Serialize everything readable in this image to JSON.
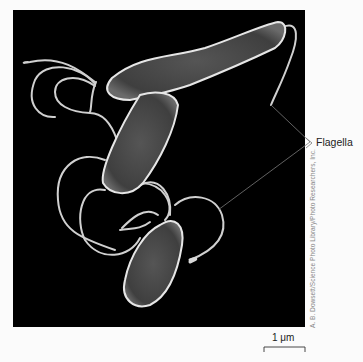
{
  "figure": {
    "labels": {
      "flagella": "Flagella"
    },
    "scale_bar": {
      "label": "1 μm"
    },
    "credit": "A. B. Dowsett/Science Photo Library/Photo Researchers, Inc.",
    "colors": {
      "background": "#fbfbfb",
      "panel": "#000000",
      "cell_body": "#4a4a4a",
      "cell_edge": "#e0e0e0",
      "flagellum": "#cfcfcf",
      "leader_line": "#7a7a7a"
    }
  }
}
